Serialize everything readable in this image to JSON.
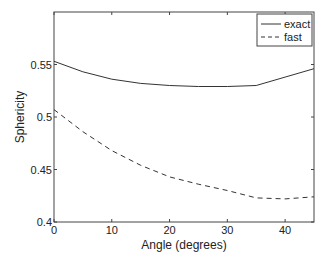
{
  "chart_data": {
    "type": "line",
    "title": "",
    "xlabel": "Angle (degrees)",
    "ylabel": "Sphericity",
    "xlim": [
      0,
      45
    ],
    "ylim": [
      0.4,
      0.6
    ],
    "xticks": [
      0,
      10,
      20,
      30,
      40
    ],
    "xtick_labels": [
      "0",
      "10",
      "20",
      "30",
      "40"
    ],
    "yticks": [
      0.4,
      0.45,
      0.5,
      0.55
    ],
    "ytick_labels": [
      "0.4",
      "0.45",
      "0.5",
      "0.55"
    ],
    "grid": false,
    "legend_position": "upper right",
    "x": [
      0,
      5,
      10,
      15,
      20,
      25,
      30,
      35,
      40,
      45
    ],
    "series": [
      {
        "name": "exact",
        "style": "solid",
        "color": "#333333",
        "values": [
          0.553,
          0.543,
          0.536,
          0.532,
          0.53,
          0.529,
          0.529,
          0.53,
          0.538,
          0.546
        ]
      },
      {
        "name": "fast",
        "style": "dashed",
        "color": "#333333",
        "values": [
          0.507,
          0.486,
          0.468,
          0.454,
          0.443,
          0.436,
          0.43,
          0.423,
          0.422,
          0.424
        ]
      }
    ]
  },
  "legend": {
    "items": [
      "exact",
      "fast"
    ]
  }
}
